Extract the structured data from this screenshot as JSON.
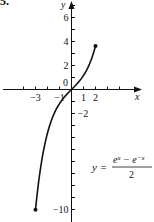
{
  "figure": {
    "problem_number": "5."
  },
  "chart_data": {
    "type": "line",
    "title": "",
    "xlabel": "x",
    "ylabel": "y",
    "function_label": "y = (e^x − e^−x)/2",
    "formula": {
      "lhs": "y =",
      "numerator": "e^x − e^−x",
      "denominator": "2"
    },
    "xlim": [
      -5.8,
      5.8
    ],
    "ylim": [
      -10.8,
      7.4
    ],
    "x_ticks": [
      -4,
      -3,
      -2,
      -1,
      1,
      2,
      3,
      4
    ],
    "x_tick_labels": [
      {
        "value": -3,
        "label": "−3"
      },
      {
        "value": -1,
        "label": "−1"
      },
      {
        "value": 1,
        "label": "1"
      },
      {
        "value": 2,
        "label": "2"
      }
    ],
    "y_ticks": [
      7,
      6,
      5,
      4,
      3,
      2,
      1,
      -1,
      -2,
      -3,
      -4,
      -5,
      -6,
      -7,
      -8,
      -9,
      -10
    ],
    "y_tick_labels": [
      {
        "value": 6,
        "label": "6"
      },
      {
        "value": 4,
        "label": "4"
      },
      {
        "value": 2,
        "label": "2"
      },
      {
        "value": -2,
        "label": "−2"
      },
      {
        "value": -10,
        "label": "−10"
      }
    ],
    "origin_label": "0",
    "grid": false,
    "series": [
      {
        "name": "sinh(x)",
        "domain": [
          -3,
          2
        ],
        "x": [
          -3,
          -2.5,
          -2,
          -1.5,
          -1,
          -0.5,
          0,
          0.5,
          1,
          1.5,
          2
        ],
        "y": [
          -10.02,
          -6.05,
          -3.63,
          -2.13,
          -1.18,
          -0.52,
          0,
          0.52,
          1.18,
          2.13,
          3.63
        ],
        "endpoints": [
          {
            "x": -3,
            "y": -10.02,
            "style": "closed"
          },
          {
            "x": 2,
            "y": 3.63,
            "style": "closed"
          }
        ]
      }
    ]
  }
}
